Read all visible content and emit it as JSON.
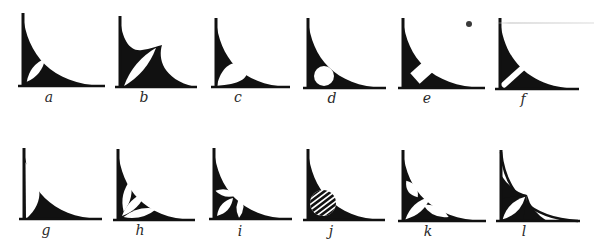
{
  "diagram": {
    "ink_color": "#111111",
    "paper_color": "#ffffff",
    "label_color": "#2a2a2a",
    "figures": [
      {
        "id": "a",
        "label": "a",
        "x": 23,
        "top": 15,
        "base": 86,
        "right": 103,
        "cutout": "leaf-diagonal"
      },
      {
        "id": "b",
        "label": "b",
        "x": 120,
        "top": 18,
        "base": 87,
        "right": 195,
        "cutout": "spike-leaf"
      },
      {
        "id": "c",
        "label": "c",
        "x": 216,
        "top": 20,
        "base": 87,
        "right": 288,
        "cutout": "teardrop"
      },
      {
        "id": "d",
        "label": "d",
        "x": 308,
        "top": 20,
        "base": 88,
        "right": 384,
        "cutout": "circle"
      },
      {
        "id": "e",
        "label": "e",
        "x": 403,
        "top": 20,
        "base": 88,
        "right": 483,
        "cutout": "diamond"
      },
      {
        "id": "f",
        "label": "f",
        "x": 500,
        "top": 20,
        "base": 89,
        "right": 577,
        "cutout": "bar"
      },
      {
        "id": "g",
        "label": "g",
        "x": 24,
        "top": 150,
        "base": 219,
        "right": 100,
        "cutout": "crescent"
      },
      {
        "id": "h",
        "label": "h",
        "x": 118,
        "top": 151,
        "base": 220,
        "right": 193,
        "cutout": "three-leaves-fan"
      },
      {
        "id": "i",
        "label": "i",
        "x": 214,
        "top": 150,
        "base": 219,
        "right": 290,
        "cutout": "three-petals"
      },
      {
        "id": "j",
        "label": "j",
        "x": 308,
        "top": 151,
        "base": 220,
        "right": 383,
        "cutout": "striped-circle"
      },
      {
        "id": "k",
        "label": "k",
        "x": 403,
        "top": 152,
        "base": 221,
        "right": 484,
        "cutout": "three-leaves-scattered"
      },
      {
        "id": "l",
        "label": "l",
        "x": 501,
        "top": 152,
        "base": 221,
        "right": 578,
        "cutout": "outlined-quadrant"
      }
    ],
    "labels": [
      {
        "text": "a",
        "x": 49,
        "y": 90
      },
      {
        "text": "b",
        "x": 144,
        "y": 90
      },
      {
        "text": "c",
        "x": 238,
        "y": 90
      },
      {
        "text": "d",
        "x": 332,
        "y": 91
      },
      {
        "text": "e",
        "x": 427,
        "y": 91
      },
      {
        "text": "f",
        "x": 523,
        "y": 92
      },
      {
        "text": "g",
        "x": 46,
        "y": 223
      },
      {
        "text": "h",
        "x": 140,
        "y": 223
      },
      {
        "text": "i",
        "x": 240,
        "y": 224
      },
      {
        "text": "j",
        "x": 331,
        "y": 224
      },
      {
        "text": "k",
        "x": 428,
        "y": 224
      },
      {
        "text": "l",
        "x": 524,
        "y": 224
      }
    ],
    "artifacts": {
      "smudge": {
        "x": 466,
        "y": 21,
        "w": 6,
        "h": 6
      },
      "scanline": {
        "x": 495,
        "y": 22,
        "w": 99
      }
    }
  }
}
